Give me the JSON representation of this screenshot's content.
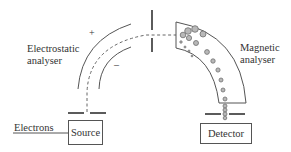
{
  "diagram": {
    "labels": {
      "electrostatic_line1": "Electrostatic",
      "electrostatic_line2": "analyser",
      "magnetic_line1": "Magnetic",
      "magnetic_line2": "analyser",
      "electrons": "Electrons",
      "source": "Source",
      "detector": "Detector",
      "plus": "+",
      "minus": "–"
    },
    "colors": {
      "line": "#555555",
      "ion_fill": "#b8b8b8",
      "ion_stroke": "#707070",
      "text": "#333333",
      "background": "#ffffff"
    }
  }
}
